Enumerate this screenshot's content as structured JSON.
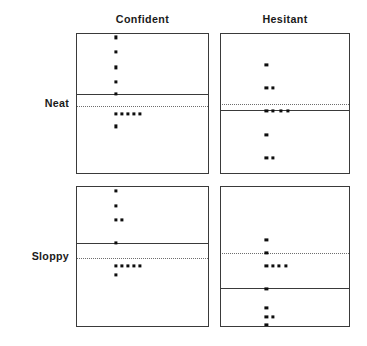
{
  "figure": {
    "type": "dot-strip-panel-grid",
    "background_color": "#ffffff",
    "dot_color": "#0d0d0d",
    "line_color": "#3a3a3a",
    "dotted_line_color": "#6e6e6e"
  },
  "columns": [
    {
      "key": "confident",
      "label": "Confident"
    },
    {
      "key": "hesitant",
      "label": "Hesitant"
    }
  ],
  "rows": [
    {
      "key": "neat",
      "label": "Neat"
    },
    {
      "key": "sloppy",
      "label": "Sloppy"
    }
  ],
  "chart_data": {
    "type": "scatter",
    "title": "",
    "xlabel": "",
    "ylabel": "",
    "grid": false,
    "legend": "none",
    "facet_columns": [
      "Confident",
      "Hesitant"
    ],
    "facet_rows": [
      "Neat",
      "Sloppy"
    ],
    "axis_note": "Dot positions given as percent of panel width (x) and panel height (y), origin at panel top-left.",
    "panels": [
      {
        "row": "Neat",
        "column": "Confident",
        "solid_line_y_pct": 43.0,
        "dotted_line_y_pct": 52.0,
        "dot_count": 11,
        "dots": [
          {
            "x_pct": 30.0,
            "y_pct": 2.5
          },
          {
            "x_pct": 30.0,
            "y_pct": 13.0
          },
          {
            "x_pct": 30.0,
            "y_pct": 24.0
          },
          {
            "x_pct": 30.0,
            "y_pct": 34.5
          },
          {
            "x_pct": 30.0,
            "y_pct": 43.0
          },
          {
            "x_pct": 30.0,
            "y_pct": 57.5
          },
          {
            "x_pct": 34.5,
            "y_pct": 57.5
          },
          {
            "x_pct": 39.0,
            "y_pct": 57.5
          },
          {
            "x_pct": 43.5,
            "y_pct": 57.5
          },
          {
            "x_pct": 48.0,
            "y_pct": 57.5
          },
          {
            "x_pct": 30.0,
            "y_pct": 66.5
          }
        ]
      },
      {
        "row": "Neat",
        "column": "Hesitant",
        "solid_line_y_pct": 55.0,
        "dotted_line_y_pct": 50.0,
        "dot_count": 10,
        "dots": [
          {
            "x_pct": 35.5,
            "y_pct": 22.0
          },
          {
            "x_pct": 35.5,
            "y_pct": 38.5
          },
          {
            "x_pct": 40.5,
            "y_pct": 38.5
          },
          {
            "x_pct": 35.5,
            "y_pct": 55.5
          },
          {
            "x_pct": 40.5,
            "y_pct": 55.5
          },
          {
            "x_pct": 46.5,
            "y_pct": 55.5
          },
          {
            "x_pct": 52.5,
            "y_pct": 55.5
          },
          {
            "x_pct": 35.5,
            "y_pct": 72.5
          },
          {
            "x_pct": 35.5,
            "y_pct": 89.0
          },
          {
            "x_pct": 40.5,
            "y_pct": 89.0
          }
        ]
      },
      {
        "row": "Sloppy",
        "column": "Confident",
        "solid_line_y_pct": 40.0,
        "dotted_line_y_pct": 51.0,
        "dot_count": 11,
        "dots": [
          {
            "x_pct": 30.0,
            "y_pct": 3.0
          },
          {
            "x_pct": 30.0,
            "y_pct": 13.5
          },
          {
            "x_pct": 30.0,
            "y_pct": 23.5
          },
          {
            "x_pct": 34.5,
            "y_pct": 23.5
          },
          {
            "x_pct": 30.0,
            "y_pct": 40.0
          },
          {
            "x_pct": 30.0,
            "y_pct": 57.0
          },
          {
            "x_pct": 34.5,
            "y_pct": 57.0
          },
          {
            "x_pct": 39.0,
            "y_pct": 57.0
          },
          {
            "x_pct": 43.5,
            "y_pct": 57.0
          },
          {
            "x_pct": 48.0,
            "y_pct": 57.0
          },
          {
            "x_pct": 30.0,
            "y_pct": 63.5
          }
        ]
      },
      {
        "row": "Sloppy",
        "column": "Hesitant",
        "solid_line_y_pct": 73.0,
        "dotted_line_y_pct": 47.5,
        "dot_count": 10,
        "dots": [
          {
            "x_pct": 35.5,
            "y_pct": 38.0
          },
          {
            "x_pct": 35.5,
            "y_pct": 47.5
          },
          {
            "x_pct": 35.5,
            "y_pct": 57.0
          },
          {
            "x_pct": 40.5,
            "y_pct": 57.0
          },
          {
            "x_pct": 45.5,
            "y_pct": 57.0
          },
          {
            "x_pct": 50.5,
            "y_pct": 57.0
          },
          {
            "x_pct": 35.5,
            "y_pct": 73.5
          },
          {
            "x_pct": 35.5,
            "y_pct": 87.0
          },
          {
            "x_pct": 35.5,
            "y_pct": 93.5
          },
          {
            "x_pct": 40.5,
            "y_pct": 93.5
          },
          {
            "x_pct": 35.5,
            "y_pct": 99.0
          }
        ]
      }
    ]
  }
}
